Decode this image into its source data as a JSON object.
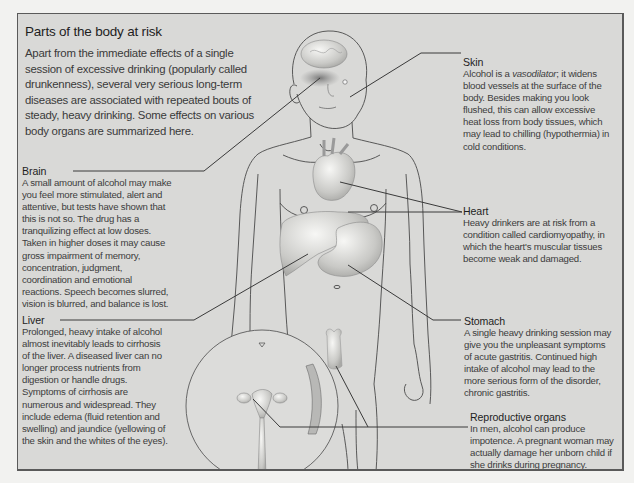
{
  "title": "Parts of the body at risk",
  "intro": "Apart from the immediate effects of a single session of excessive drinking (popularly called drunkenness), several very serious long-term diseases are associated with repeated bouts of steady, heavy drinking. Some effects on various body organs are summarized here.",
  "callouts": {
    "brain": {
      "heading": "Brain",
      "body": "A small amount of alcohol may make you feel more stimulated, alert and attentive, but tests have shown that this is not so. The drug has a tranquilizing effect at low doses. Taken in higher doses it may cause gross impairment of memory, concentration, judgment, coordination and emotional reactions. Speech becomes slurred, vision is blurred, and balance is lost."
    },
    "liver": {
      "heading": "Liver",
      "body": "Prolonged, heavy intake of alcohol almost inevitably leads to cirrhosis of the liver. A diseased liver can no longer process nutrients from digestion or handle drugs. Symptoms of cirrhosis are numerous and widespread. They include edema (fluid retention and swelling) and jaundice (yellowing of the skin and the whites of the eyes)."
    },
    "skin": {
      "heading": "Skin",
      "body_before": "Alcohol is a ",
      "body_italic": "vasodilator",
      "body_after": "; it widens blood vessels at the surface of the body. Besides making you look flushed, this can allow excessive heat loss from body tissues, which may lead to chilling (hypothermia) in cold conditions."
    },
    "heart": {
      "heading": "Heart",
      "body": "Heavy drinkers are at risk from a condition called cardiomyopathy, in which the heart's muscular tissues become weak and damaged."
    },
    "stomach": {
      "heading": "Stomach",
      "body": "A single heavy drinking session may give you the unpleasant symptoms of acute gastritis. Continued high intake of alcohol may lead to the more serious form of the disorder, chronic gastritis."
    },
    "reproductive": {
      "heading": "Reproductive organs",
      "body": "In men, alcohol can produce impotence. A pregnant woman may actually damage her unborn child if she drinks during pregnancy."
    }
  },
  "colors": {
    "panel_background": "#d9d9d7",
    "page_background": "#f2f2f0",
    "line": "#3a3a3a",
    "border": "#5a5a5a"
  }
}
